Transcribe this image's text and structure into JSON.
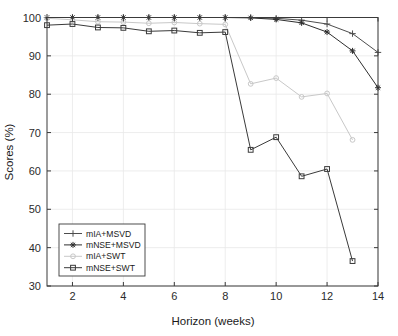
{
  "chart_data": {
    "type": "line",
    "title": "",
    "subtitle": "",
    "xlabel": "Horizon (weeks)",
    "ylabel": "Scores (%)",
    "xlim": [
      1,
      14
    ],
    "ylim": [
      30,
      100
    ],
    "xticks": [
      2,
      4,
      6,
      8,
      10,
      12,
      14
    ],
    "yticks": [
      30,
      40,
      50,
      60,
      70,
      80,
      90,
      100
    ],
    "xticklabels": [
      "2",
      "4",
      "6",
      "8",
      "10",
      "12",
      "14"
    ],
    "yticklabels": [
      "30",
      "40",
      "50",
      "60",
      "70",
      "80",
      "90",
      "100"
    ],
    "grid": true,
    "legend_position": "lower-left",
    "x": [
      1,
      2,
      3,
      4,
      5,
      6,
      7,
      8,
      9,
      10,
      11,
      12,
      13,
      14
    ],
    "series": [
      {
        "name": "mIA+MSVD",
        "marker": "plus",
        "color": "#4d4d4d",
        "values": [
          100,
          100,
          100,
          100,
          100,
          100,
          100,
          100,
          100,
          99.8,
          99.3,
          98.3,
          95.8,
          90.9
        ]
      },
      {
        "name": "mNSE+MSVD",
        "marker": "asterisk",
        "color": "#2e2e2e",
        "values": [
          100,
          100,
          100,
          100,
          100,
          100,
          100,
          100,
          99.9,
          99.5,
          98.6,
          96.2,
          91.3,
          81.7
        ]
      },
      {
        "name": "mIA+SWT",
        "marker": "circle",
        "color": "#c8c8c8",
        "values": [
          99.8,
          99.4,
          98.9,
          98.8,
          98.5,
          98.7,
          98.4,
          98.2,
          82.7,
          84.2,
          79.3,
          80.2,
          68.1,
          null
        ]
      },
      {
        "name": "mNSE+SWT",
        "marker": "square",
        "color": "#3a3a3a",
        "values": [
          98.0,
          98.3,
          97.4,
          97.3,
          96.4,
          96.6,
          96.0,
          96.2,
          65.5,
          68.8,
          58.6,
          60.5,
          36.5,
          null
        ]
      }
    ],
    "legend_entries": [
      {
        "label": "mIA+MSVD",
        "marker": "plus",
        "color": "#4d4d4d"
      },
      {
        "label": "mNSE+MSVD",
        "marker": "asterisk",
        "color": "#2e2e2e"
      },
      {
        "label": "mIA+SWT",
        "marker": "circle",
        "color": "#c8c8c8"
      },
      {
        "label": "mNSE+SWT",
        "marker": "square",
        "color": "#3a3a3a"
      }
    ],
    "colors": {
      "axis": "#3a3a3a",
      "grid": "#e8e8e8",
      "background": "#ffffff",
      "text": "#1a1a1a"
    }
  }
}
